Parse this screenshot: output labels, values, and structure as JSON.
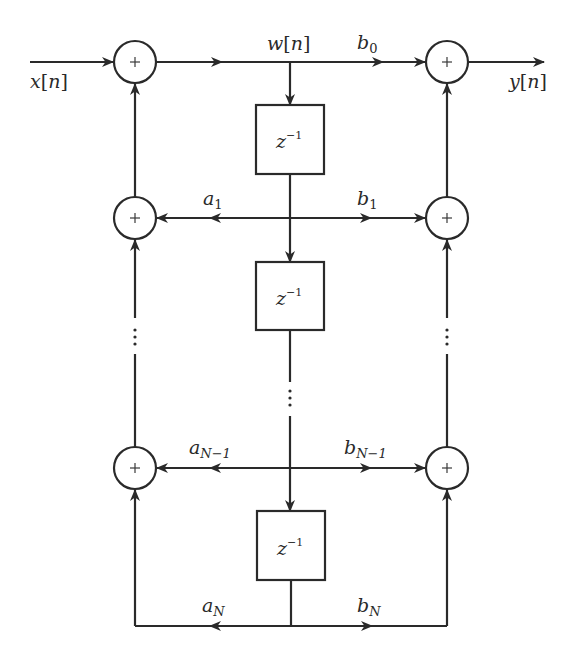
{
  "diagram": {
    "type": "block-diagram",
    "title_visible": false,
    "signals": {
      "input": {
        "var": "x",
        "arg": "n"
      },
      "internal": {
        "var": "w",
        "arg": "n"
      },
      "output": {
        "var": "y",
        "arg": "n"
      }
    },
    "delay_label": {
      "base": "z",
      "exponent": "−1"
    },
    "adder_symbol": "+",
    "coefficients": {
      "feedforward": [
        {
          "base": "b",
          "sub": "0"
        },
        {
          "base": "b",
          "sub": "1"
        },
        {
          "base": "b",
          "sub": "N−1"
        },
        {
          "base": "b",
          "sub": "N"
        }
      ],
      "feedback": [
        {
          "base": "a",
          "sub": "1"
        },
        {
          "base": "a",
          "sub": "N−1"
        },
        {
          "base": "a",
          "sub": "N"
        }
      ]
    },
    "ellipsis": "⋮",
    "colors": {
      "line": "#2a2a2a",
      "background": "#ffffff"
    }
  }
}
